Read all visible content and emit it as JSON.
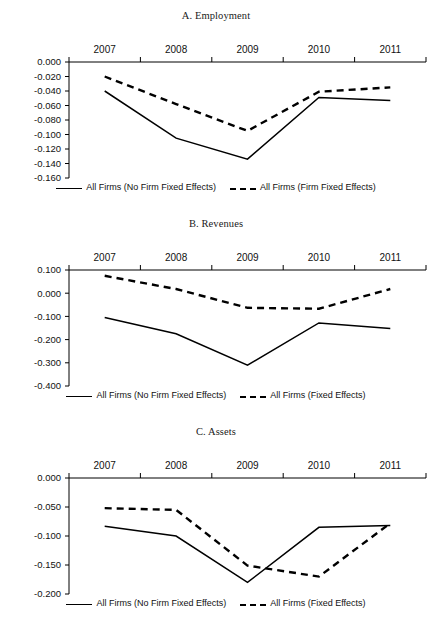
{
  "figure": {
    "panels": [
      {
        "id": "a",
        "title": "A. Employment",
        "x_categories": [
          "2007",
          "2008",
          "2009",
          "2010",
          "2011"
        ],
        "y_ticks": [
          "0.000",
          "-0.020",
          "-0.040",
          "-0.060",
          "-0.080",
          "-0.100",
          "-0.120",
          "-0.140",
          "-0.160"
        ],
        "legend": [
          {
            "label": "All Firms (No Firm Fixed Effects)",
            "style": "solid"
          },
          {
            "label": "All Firms (Firm Fixed Effects)",
            "style": "dashed"
          }
        ]
      },
      {
        "id": "b",
        "title": "B. Revenues",
        "x_categories": [
          "2007",
          "2008",
          "2009",
          "2010",
          "2011"
        ],
        "y_ticks": [
          "0.100",
          "0.000",
          "-0.100",
          "-0.200",
          "-0.300",
          "-0.400"
        ],
        "legend": [
          {
            "label": "All Firms (No Firm Fixed Effects)",
            "style": "solid"
          },
          {
            "label": "All Firms (Fixed Effects)",
            "style": "dashed"
          }
        ]
      },
      {
        "id": "c",
        "title": "C. Assets",
        "x_categories": [
          "2007",
          "2008",
          "2009",
          "2010",
          "2011"
        ],
        "y_ticks": [
          "0.000",
          "-0.050",
          "-0.100",
          "-0.150",
          "-0.200"
        ],
        "legend": [
          {
            "label": "All Firms (No Firm Fixed Effects)",
            "style": "solid"
          },
          {
            "label": "All Firms (Fixed Effects)",
            "style": "dashed"
          }
        ]
      }
    ]
  },
  "chart_data": [
    {
      "type": "line",
      "title": "A. Employment",
      "xlabel": "",
      "ylabel": "",
      "categories": [
        "2007",
        "2008",
        "2009",
        "2010",
        "2011"
      ],
      "ylim": [
        -0.16,
        0.0
      ],
      "ytick_step": 0.02,
      "yticks": [
        0.0,
        -0.02,
        -0.04,
        -0.06,
        -0.08,
        -0.1,
        -0.12,
        -0.14,
        -0.16
      ],
      "grid": false,
      "legend_position": "bottom",
      "series": [
        {
          "name": "All Firms (No Firm Fixed Effects)",
          "style": "solid",
          "values": [
            -0.04,
            -0.105,
            -0.134,
            -0.049,
            -0.053
          ]
        },
        {
          "name": "All Firms (Firm Fixed Effects)",
          "style": "dashed",
          "values": [
            -0.02,
            -0.058,
            -0.095,
            -0.041,
            -0.035
          ]
        }
      ]
    },
    {
      "type": "line",
      "title": "B. Revenues",
      "xlabel": "",
      "ylabel": "",
      "categories": [
        "2007",
        "2008",
        "2009",
        "2010",
        "2011"
      ],
      "ylim": [
        -0.4,
        0.1
      ],
      "ytick_step": 0.1,
      "yticks": [
        0.1,
        0.0,
        -0.1,
        -0.2,
        -0.3,
        -0.4
      ],
      "grid": false,
      "legend_position": "bottom",
      "series": [
        {
          "name": "All Firms (No Firm Fixed Effects)",
          "style": "solid",
          "values": [
            -0.105,
            -0.175,
            -0.31,
            -0.128,
            -0.152
          ]
        },
        {
          "name": "All Firms (Fixed Effects)",
          "style": "dashed",
          "values": [
            0.075,
            0.018,
            -0.063,
            -0.067,
            0.018
          ]
        }
      ]
    },
    {
      "type": "line",
      "title": "C. Assets",
      "xlabel": "",
      "ylabel": "",
      "categories": [
        "2007",
        "2008",
        "2009",
        "2010",
        "2011"
      ],
      "ylim": [
        -0.2,
        0.0
      ],
      "ytick_step": 0.05,
      "yticks": [
        0.0,
        -0.05,
        -0.1,
        -0.15,
        -0.2
      ],
      "grid": false,
      "legend_position": "bottom",
      "series": [
        {
          "name": "All Firms (No Firm Fixed Effects)",
          "style": "solid",
          "values": [
            -0.083,
            -0.1,
            -0.18,
            -0.085,
            -0.082
          ]
        },
        {
          "name": "All Firms (Fixed Effects)",
          "style": "dashed",
          "values": [
            -0.052,
            -0.055,
            -0.151,
            -0.17,
            -0.078
          ]
        }
      ]
    }
  ],
  "colors": {
    "line": "#000000",
    "axis": "#000000",
    "text": "#111111",
    "background": "#ffffff"
  }
}
